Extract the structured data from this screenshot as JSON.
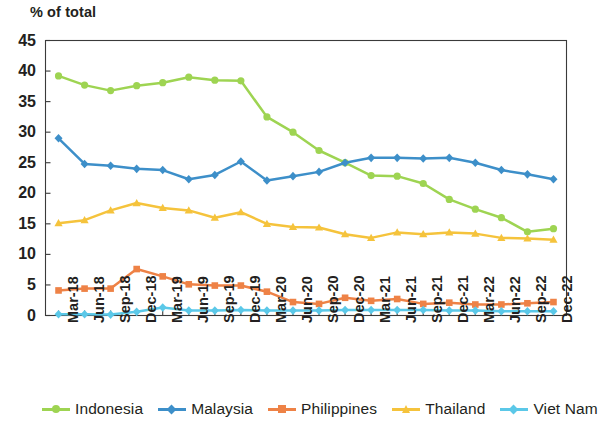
{
  "chart_data": {
    "type": "line",
    "title": "% of total",
    "xlabel": "",
    "ylabel": "% of total",
    "ylim": [
      0,
      45
    ],
    "ytick_step": 5,
    "yticks": [
      0,
      5,
      10,
      15,
      20,
      25,
      30,
      35,
      40,
      45
    ],
    "grid": false,
    "legend_position": "bottom",
    "categories": [
      "Mar-18",
      "Jun-18",
      "Sep-18",
      "Dec-18",
      "Mar-19",
      "Jun-19",
      "Sep-19",
      "Dec-19",
      "Mar-20",
      "Jun-20",
      "Sep-20",
      "Dec-20",
      "Mar-21",
      "Jun-21",
      "Sep-21",
      "Dec-21",
      "Mar-22",
      "Jun-22",
      "Sep-22",
      "Dec-22"
    ],
    "series": [
      {
        "name": "Indonesia",
        "color": "#9ed452",
        "marker": "circle",
        "values": [
          39.2,
          37.7,
          36.8,
          37.6,
          38.1,
          39.0,
          38.5,
          38.4,
          32.5,
          30.0,
          27.0,
          25.0,
          22.9,
          22.8,
          21.6,
          19.0,
          17.4,
          16.0,
          13.7,
          14.2
        ]
      },
      {
        "name": "Malaysia",
        "color": "#3d8fc9",
        "marker": "diamond",
        "values": [
          29.0,
          24.8,
          24.5,
          24.0,
          23.8,
          22.3,
          23.0,
          25.2,
          22.1,
          22.8,
          23.5,
          25.0,
          25.8,
          25.8,
          25.7,
          25.8,
          25.0,
          23.8,
          23.1,
          22.3
        ]
      },
      {
        "name": "Philippines",
        "color": "#ee8246",
        "marker": "square",
        "values": [
          4.1,
          4.4,
          4.4,
          7.6,
          6.4,
          5.1,
          4.9,
          4.9,
          3.9,
          2.2,
          1.9,
          2.9,
          2.4,
          2.7,
          1.9,
          2.1,
          1.8,
          1.8,
          2.0,
          2.2
        ]
      },
      {
        "name": "Thailand",
        "color": "#f5c33c",
        "marker": "triangle",
        "values": [
          15.1,
          15.6,
          17.2,
          18.4,
          17.6,
          17.2,
          16.0,
          16.9,
          15.0,
          14.5,
          14.4,
          13.3,
          12.7,
          13.6,
          13.3,
          13.6,
          13.4,
          12.7,
          12.6,
          12.4
        ]
      },
      {
        "name": "Viet Nam",
        "color": "#5bc8e8",
        "marker": "diamond",
        "values": [
          0.2,
          0.2,
          0.15,
          0.6,
          1.3,
          0.8,
          0.8,
          0.9,
          0.8,
          0.8,
          0.8,
          0.9,
          0.9,
          0.9,
          0.9,
          0.8,
          0.8,
          0.7,
          0.7,
          0.7
        ]
      }
    ]
  },
  "axis": {
    "title": "% of total"
  },
  "legend": {
    "items": [
      {
        "label": "Indonesia",
        "color": "#9ed452"
      },
      {
        "label": "Malaysia",
        "color": "#3d8fc9"
      },
      {
        "label": "Philippines",
        "color": "#ee8246"
      },
      {
        "label": "Thailand",
        "color": "#f5c33c"
      },
      {
        "label": "Viet Nam",
        "color": "#5bc8e8"
      }
    ]
  }
}
